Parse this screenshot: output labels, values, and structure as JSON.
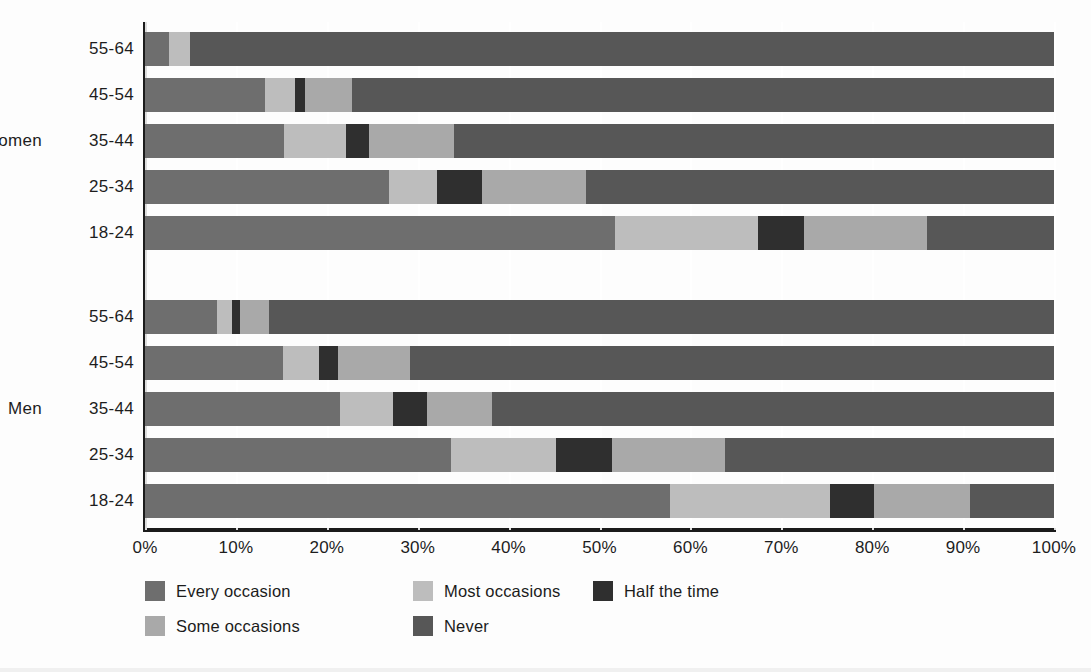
{
  "figure": {
    "title_partial": "",
    "group_labels": [
      "Women",
      "Men"
    ],
    "x_tick_labels": [
      "0%",
      "10%",
      "20%",
      "30%",
      "40%",
      "50%",
      "60%",
      "70%",
      "80%",
      "90%",
      "100%"
    ]
  },
  "legend": {
    "items": [
      {
        "label": "Every occasion",
        "color": "#6e6e6e"
      },
      {
        "label": "Most occasions",
        "color": "#bdbdbd"
      },
      {
        "label": "Half the time",
        "color": "#2f2f2f"
      },
      {
        "label": "Some occasions",
        "color": "#a9a9a9"
      },
      {
        "label": "Never",
        "color": "#575757"
      }
    ]
  },
  "chart_data": {
    "type": "bar",
    "orientation": "horizontal",
    "stacked": true,
    "stack_mode": "percent",
    "title": "",
    "xlabel": "",
    "ylabel": "",
    "xlim": [
      0,
      100
    ],
    "xticks": [
      0,
      10,
      20,
      30,
      40,
      50,
      60,
      70,
      80,
      90,
      100
    ],
    "xtick_labels": [
      "0%",
      "10%",
      "20%",
      "30%",
      "40%",
      "50%",
      "60%",
      "70%",
      "80%",
      "90%",
      "100%"
    ],
    "grid": true,
    "legend_position": "bottom-left",
    "series": [
      {
        "name": "Every occasion",
        "color": "#6e6e6e",
        "values": [
          2.6,
          13.2,
          15.3,
          26.8,
          51.7,
          7.9,
          15.2,
          21.5,
          33.7,
          57.8
        ]
      },
      {
        "name": "Most occasions",
        "color": "#bdbdbd",
        "values": [
          2.4,
          3.3,
          6.8,
          5.3,
          15.7,
          1.7,
          3.9,
          5.8,
          11.5,
          17.6
        ]
      },
      {
        "name": "Half the time",
        "color": "#2f2f2f",
        "values": [
          0.0,
          1.1,
          2.5,
          5.0,
          5.1,
          0.9,
          2.1,
          3.7,
          6.2,
          4.8
        ]
      },
      {
        "name": "Some occasions",
        "color": "#a9a9a9",
        "values": [
          0.0,
          5.2,
          9.4,
          11.4,
          13.5,
          3.1,
          8.0,
          7.2,
          12.4,
          10.6
        ]
      },
      {
        "name": "Never",
        "color": "#575757",
        "values": [
          95.0,
          77.2,
          66.0,
          51.5,
          14.0,
          86.4,
          70.8,
          61.8,
          36.2,
          9.2
        ]
      }
    ],
    "groups": [
      {
        "group": "Women",
        "categories": [
          "55-64",
          "45-54",
          "35-44",
          "25-34",
          "18-24"
        ],
        "rows": [
          {
            "category": "55-64",
            "Every occasion": 2.6,
            "Most occasions": 2.4,
            "Half the time": 0.0,
            "Some occasions": 0.0,
            "Never": 95.0
          },
          {
            "category": "45-54",
            "Every occasion": 13.2,
            "Most occasions": 3.3,
            "Half the time": 1.1,
            "Some occasions": 5.2,
            "Never": 77.2
          },
          {
            "category": "35-44",
            "Every occasion": 15.3,
            "Most occasions": 6.8,
            "Half the time": 2.5,
            "Some occasions": 9.4,
            "Never": 66.0
          },
          {
            "category": "25-34",
            "Every occasion": 26.8,
            "Most occasions": 5.3,
            "Half the time": 5.0,
            "Some occasions": 11.4,
            "Never": 51.5
          },
          {
            "category": "18-24",
            "Every occasion": 51.7,
            "Most occasions": 15.7,
            "Half the time": 5.1,
            "Some occasions": 13.5,
            "Never": 14.0
          }
        ]
      },
      {
        "group": "Men",
        "categories": [
          "55-64",
          "45-54",
          "35-44",
          "25-34",
          "18-24"
        ],
        "rows": [
          {
            "category": "55-64",
            "Every occasion": 7.9,
            "Most occasions": 1.7,
            "Half the time": 0.9,
            "Some occasions": 3.1,
            "Never": 86.4
          },
          {
            "category": "45-54",
            "Every occasion": 15.2,
            "Most occasions": 3.9,
            "Half the time": 2.1,
            "Some occasions": 8.0,
            "Never": 70.8
          },
          {
            "category": "35-44",
            "Every occasion": 21.5,
            "Most occasions": 5.8,
            "Half the time": 3.7,
            "Some occasions": 7.2,
            "Never": 61.8
          },
          {
            "category": "25-34",
            "Every occasion": 33.7,
            "Most occasions": 11.5,
            "Half the time": 6.2,
            "Some occasions": 12.4,
            "Never": 36.2
          },
          {
            "category": "18-24",
            "Every occasion": 57.8,
            "Most occasions": 17.6,
            "Half the time": 4.8,
            "Some occasions": 10.6,
            "Never": 9.2
          }
        ]
      }
    ]
  }
}
